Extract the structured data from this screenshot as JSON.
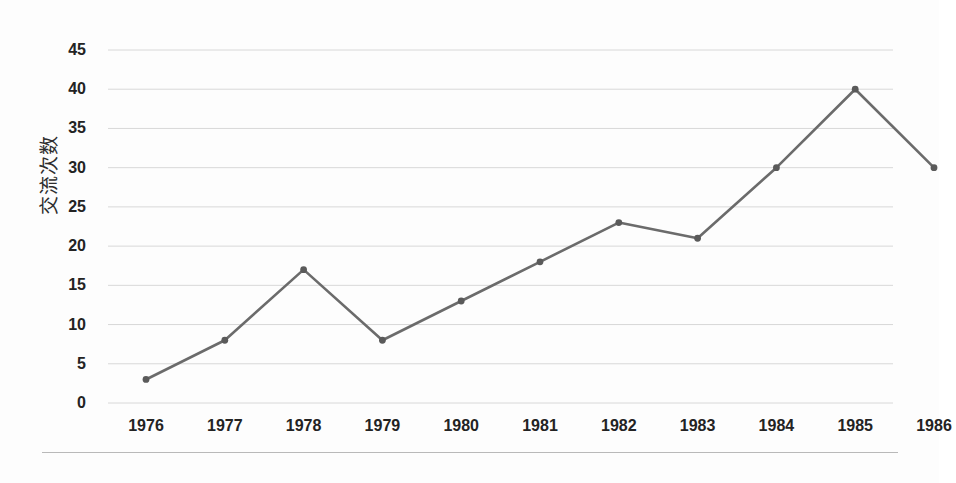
{
  "chart_data": {
    "type": "line",
    "title": "",
    "xlabel": "",
    "ylabel": "交流次数",
    "categories": [
      "1976",
      "1977",
      "1978",
      "1979",
      "1980",
      "1981",
      "1982",
      "1983",
      "1984",
      "1985",
      "1986"
    ],
    "values": [
      3,
      8,
      17,
      8,
      13,
      18,
      23,
      21,
      30,
      40,
      30
    ],
    "series": [
      {
        "name": "交流次数",
        "values": [
          3,
          8,
          17,
          8,
          13,
          18,
          23,
          21,
          30,
          40,
          30
        ]
      }
    ],
    "yticks": [
      0,
      5,
      10,
      15,
      20,
      25,
      30,
      35,
      40,
      45
    ],
    "ylim": [
      0,
      45
    ],
    "grid": "horizontal",
    "legend": "none",
    "marker": "circle",
    "line_color": "#6b6b6b",
    "marker_color": "#5a5a5a",
    "grid_color": "#d8d8d8",
    "text_color": "#232323",
    "background": "#fdfdfd"
  },
  "axes": {
    "y_title": "交流次数",
    "y_tick_labels": [
      "45",
      "40",
      "35",
      "30",
      "25",
      "20",
      "15",
      "10",
      "5",
      "0"
    ],
    "x_tick_labels": [
      "1976",
      "1977",
      "1978",
      "1979",
      "1980",
      "1981",
      "1982",
      "1983",
      "1984",
      "1985",
      "1986"
    ]
  }
}
